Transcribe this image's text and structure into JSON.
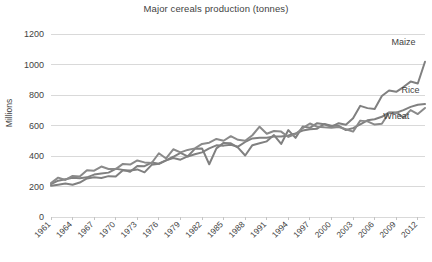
{
  "chart_data": {
    "type": "line",
    "title": "Major cereals production (tonnes)",
    "xlabel": "",
    "ylabel": "Millions",
    "ylim": [
      0,
      1200
    ],
    "ytick_step": 200,
    "yticks": [
      "0",
      "200",
      "400",
      "600",
      "800",
      "1000",
      "1200"
    ],
    "grid": true,
    "legend_position": "inline-right-of-series",
    "x_start": 1961,
    "x_end": 2013,
    "xtick_labels": [
      "1961",
      "1964",
      "1967",
      "1970",
      "1973",
      "1976",
      "1979",
      "1982",
      "1985",
      "1988",
      "1991",
      "1994",
      "1997",
      "2000",
      "2003",
      "2006",
      "2009",
      "2012"
    ],
    "x": [
      1961,
      1962,
      1963,
      1964,
      1965,
      1966,
      1967,
      1968,
      1969,
      1970,
      1971,
      1972,
      1973,
      1974,
      1975,
      1976,
      1977,
      1978,
      1979,
      1980,
      1981,
      1982,
      1983,
      1984,
      1985,
      1986,
      1987,
      1988,
      1989,
      1990,
      1991,
      1992,
      1993,
      1994,
      1995,
      1996,
      1997,
      1998,
      1999,
      2000,
      2001,
      2002,
      2003,
      2004,
      2005,
      2006,
      2007,
      2008,
      2009,
      2010,
      2011,
      2012,
      2013
    ],
    "series": [
      {
        "name": "Maize",
        "color": "#808080",
        "label_x_value": 2010,
        "label_y_value": 1130,
        "values": [
          205,
          212,
          220,
          212,
          226,
          253,
          260,
          256,
          268,
          266,
          307,
          305,
          312,
          293,
          342,
          349,
          371,
          395,
          421,
          397,
          447,
          450,
          346,
          450,
          486,
          483,
          455,
          403,
          471,
          484,
          496,
          537,
          479,
          570,
          519,
          594,
          585,
          615,
          608,
          592,
          615,
          605,
          647,
          729,
          714,
          708,
          793,
          830,
          821,
          852,
          888,
          875,
          1018
        ]
      },
      {
        "name": "Rice",
        "color": "#808080",
        "label_x_value": 2011,
        "label_y_value": 810,
        "values": [
          216,
          238,
          248,
          258,
          254,
          260,
          278,
          285,
          291,
          316,
          309,
          297,
          335,
          333,
          357,
          349,
          371,
          387,
          376,
          397,
          411,
          424,
          450,
          470,
          468,
          474,
          461,
          492,
          515,
          519,
          519,
          528,
          528,
          535,
          548,
          567,
          576,
          579,
          610,
          598,
          598,
          570,
          583,
          607,
          634,
          641,
          657,
          686,
          684,
          701,
          722,
          736,
          741
        ]
      },
      {
        "name": "Wheat",
        "color": "#8a8a8a",
        "label_x_value": 2009,
        "label_y_value": 640,
        "values": [
          222,
          258,
          243,
          269,
          265,
          307,
          304,
          331,
          315,
          314,
          348,
          344,
          371,
          358,
          354,
          418,
          384,
          444,
          424,
          440,
          450,
          479,
          487,
          512,
          500,
          530,
          506,
          500,
          536,
          592,
          546,
          564,
          560,
          525,
          543,
          583,
          613,
          592,
          588,
          586,
          590,
          575,
          560,
          632,
          627,
          606,
          611,
          684,
          686,
          652,
          701,
          675,
          715
        ]
      }
    ]
  }
}
